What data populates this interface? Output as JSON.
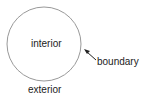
{
  "diagram": {
    "labels": {
      "interior": "interior",
      "boundary": "boundary",
      "exterior": "exterior"
    },
    "circle": {
      "cx": 44,
      "cy": 44,
      "r": 37,
      "stroke": "#999999"
    },
    "arrow": {
      "from": [
        95,
        60
      ],
      "to": [
        84,
        50
      ],
      "color": "#222222"
    }
  }
}
